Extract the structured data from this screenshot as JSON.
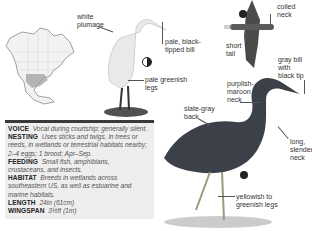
{
  "range_map": {
    "label": "North America range map"
  },
  "egret": {
    "labels": {
      "plumage": [
        "white",
        "plumage"
      ],
      "bill": [
        "pale, black-",
        "tipped bill"
      ],
      "legs": [
        "pale greenish",
        "legs"
      ]
    },
    "icon": "moon-half-icon"
  },
  "flight": {
    "labels": {
      "neck": [
        "coiled",
        "neck"
      ],
      "tail": [
        "short",
        "tail"
      ]
    },
    "icon": "flight-icon"
  },
  "heron": {
    "labels": {
      "bill": [
        "gray bill",
        "with",
        "black tip"
      ],
      "neck_color": [
        "purplish-",
        "maroon",
        "neck"
      ],
      "back": [
        "slate-gray",
        "back"
      ],
      "neck_shape": [
        "long,",
        "slender",
        "neck"
      ],
      "legs": [
        "yellowish to",
        "greenish legs"
      ]
    },
    "icon": "flight-icon"
  },
  "info": {
    "voice": {
      "key": "VOICE",
      "value": "Vocal during courtship; generally silent."
    },
    "nesting": {
      "key": "NESTING",
      "value_lines": [
        "Uses sticks and twigs, in trees or",
        "reeds, in wetlands or terrestrial habitats nearby;",
        "2–4 eggs; 1 brood; Apr–Sep."
      ]
    },
    "feeding": {
      "key": "FEEDING",
      "value_lines": [
        "Small fish, amphibians,",
        "crustaceans, and insects."
      ]
    },
    "habitat": {
      "key": "HABITAT",
      "value_lines": [
        "Breeds in wetlands across",
        "southeastern US, as well as estuarine and",
        "marine habitats."
      ]
    },
    "length": {
      "key": "LENGTH",
      "value": "24in (61cm)"
    },
    "wingspan": {
      "key": "WINGSPAN",
      "value": "3½ft (1m)"
    }
  },
  "colors": {
    "infobox_bg": "#eeeeee",
    "bar": "#3a3a3a",
    "text": "#333333"
  }
}
